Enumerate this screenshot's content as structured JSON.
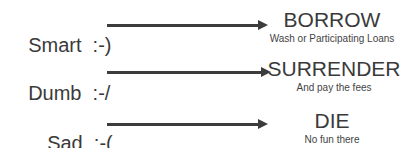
{
  "rows": [
    {
      "mood": "Smart",
      "emoticon": ":-)",
      "outcome": "BORROW",
      "detail": "Wash or Participating Loans"
    },
    {
      "mood": "Dumb",
      "emoticon": ":-/",
      "outcome": "SURRENDER",
      "detail": "And pay the fees"
    },
    {
      "mood": "Sad",
      "emoticon": ":-(",
      "outcome": "DIE",
      "detail": "No fun there"
    }
  ],
  "colors": {
    "text": "#3a3a3a",
    "arrow": "#3c3c3c",
    "background": "#ffffff"
  }
}
